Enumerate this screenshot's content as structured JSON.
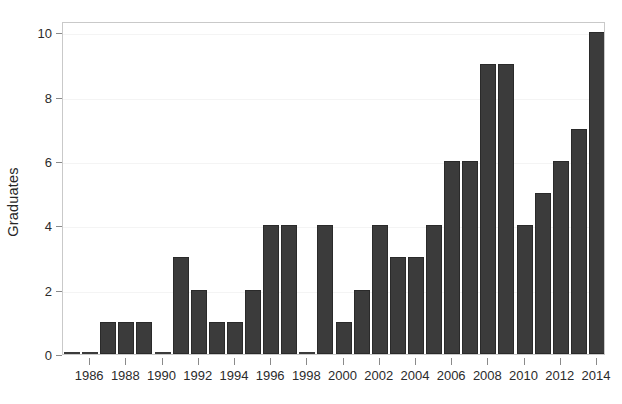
{
  "chart_data": {
    "type": "bar",
    "title": "",
    "subtitle": "",
    "xlabel": "",
    "ylabel": "Graduates",
    "categories": [
      1985,
      1986,
      1987,
      1988,
      1989,
      1990,
      1991,
      1992,
      1993,
      1994,
      1995,
      1996,
      1997,
      1998,
      1999,
      2000,
      2001,
      2002,
      2003,
      2004,
      2005,
      2006,
      2007,
      2008,
      2009,
      2010,
      2011,
      2012,
      2013,
      2014
    ],
    "values": [
      0,
      0,
      1,
      1,
      1,
      0,
      3,
      2,
      1,
      1,
      2,
      4,
      4,
      0,
      4,
      1,
      2,
      4,
      3,
      3,
      4,
      6,
      6,
      9,
      9,
      4,
      5,
      6,
      7,
      10
    ],
    "series": [
      {
        "name": "Graduates",
        "values": [
          0,
          0,
          1,
          1,
          1,
          0,
          3,
          2,
          1,
          1,
          2,
          4,
          4,
          0,
          4,
          1,
          2,
          4,
          3,
          3,
          4,
          6,
          6,
          9,
          9,
          4,
          5,
          6,
          7,
          10
        ]
      }
    ],
    "xlim": [
      1984.5,
      2014.5
    ],
    "ylim": [
      0,
      10.35
    ],
    "y_ticks": [
      0,
      2,
      4,
      6,
      8,
      10
    ],
    "y_tick_labels": [
      "0",
      "2",
      "4",
      "6",
      "8",
      "10"
    ],
    "x_ticks": [
      1986,
      1988,
      1990,
      1992,
      1994,
      1996,
      1998,
      2000,
      2002,
      2004,
      2006,
      2008,
      2010,
      2012,
      2014
    ],
    "x_tick_labels": [
      "1986",
      "1988",
      "1990",
      "1992",
      "1994",
      "1996",
      "1998",
      "2000",
      "2002",
      "2004",
      "2006",
      "2008",
      "2010",
      "2012",
      "2014"
    ],
    "grid": true,
    "grid_axis": "y",
    "legend": false,
    "legend_position": "none",
    "bar_color": "#3b3b3b",
    "bar_edge_color": "#2a2a2a",
    "grid_color": "#f4f4f4",
    "frame_color": "#c9c9c9",
    "background_color": "#ffffff",
    "text_color": "#2b2b2b"
  }
}
